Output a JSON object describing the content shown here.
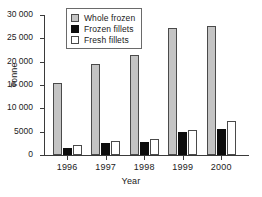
{
  "chart_data": {
    "type": "bar",
    "title": "",
    "xlabel": "Year",
    "ylabel": "Tonne",
    "categories": [
      "1996",
      "1997",
      "1998",
      "1999",
      "2000"
    ],
    "series": [
      {
        "name": "Whole frozen",
        "color": "#c4c4c4",
        "values": [
          15500,
          19500,
          21500,
          27200,
          27700
        ]
      },
      {
        "name": "Frozen fillets",
        "color": "#0d0d0d",
        "values": [
          1500,
          2600,
          2700,
          5000,
          5600
        ]
      },
      {
        "name": "Fresh fillets",
        "color": "#ffffff",
        "values": [
          2100,
          2900,
          3500,
          5400,
          7300
        ]
      }
    ],
    "ylim": [
      0,
      30000
    ],
    "ytick_values": [
      0,
      5000,
      10000,
      15000,
      20000,
      25000,
      30000
    ],
    "ytick_labels": [
      "0",
      "5000",
      "10 000",
      "15 000",
      "20 000",
      "25 000",
      "30 000"
    ],
    "grid": false,
    "legend_position": "top-center",
    "legend_entries": [
      "Whole frozen",
      "Frozen fillets",
      "Fresh fillets"
    ]
  }
}
